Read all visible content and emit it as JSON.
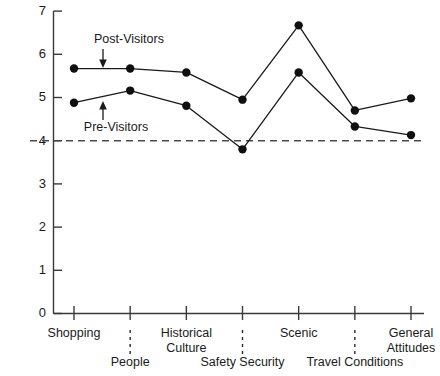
{
  "chart_data": {
    "type": "line",
    "title": "",
    "xlabel": "",
    "ylabel": "",
    "ylim": [
      0,
      7
    ],
    "y_ticks": [
      0,
      1,
      2,
      3,
      4,
      5,
      6,
      7
    ],
    "y_tick_labels": [
      "0",
      "1",
      "2",
      "3",
      "4",
      "5",
      "6",
      "7"
    ],
    "grid": false,
    "legend_position": "inline-annotation",
    "categories": [
      "Shopping",
      "People",
      "Historical Culture",
      "Safety Security",
      "Scenic",
      "Travel Conditions",
      "General Attitudes"
    ],
    "category_label_lines": [
      [
        "Shopping"
      ],
      [
        "People"
      ],
      [
        "Historical",
        "Culture"
      ],
      [
        "Safety Security"
      ],
      [
        "Scenic"
      ],
      [
        "Travel Conditions"
      ],
      [
        "General",
        "Attitudes"
      ]
    ],
    "series": [
      {
        "name": "Post-Visitors",
        "values": [
          5.67,
          5.67,
          5.58,
          4.95,
          6.67,
          4.7,
          4.98
        ]
      },
      {
        "name": "Pre-Visitors",
        "values": [
          4.88,
          5.16,
          4.81,
          3.8,
          5.58,
          4.33,
          4.13
        ]
      }
    ],
    "reference_line": {
      "value": 4.0,
      "style": "dashed"
    },
    "annotations": [
      {
        "text": "Post-Visitors",
        "series": "Post-Visitors",
        "arrow": "down"
      },
      {
        "text": "Pre-Visitors",
        "series": "Pre-Visitors",
        "arrow": "up"
      }
    ]
  },
  "colors": {
    "line": "#1a1a1a",
    "marker": "#101010",
    "axis": "#3a3a3a",
    "reference": "#4a4a4a",
    "background": "#ffffff"
  }
}
